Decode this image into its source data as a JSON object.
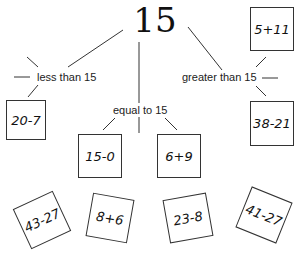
{
  "root": {
    "value": "15"
  },
  "categories": {
    "less": {
      "label": "less than 15"
    },
    "equal": {
      "label": "equal to 15"
    },
    "greater": {
      "label": "greater than 15"
    }
  },
  "sorted_cards": {
    "less": [
      "20-7"
    ],
    "equal": [
      "15-0",
      "6+9"
    ],
    "greater": [
      "5+11",
      "38-21"
    ]
  },
  "unsorted_cards": [
    "43-27",
    "8+6",
    "23-8",
    "41-27"
  ],
  "colors": {
    "line": "#333333",
    "text": "#111111",
    "background": "#ffffff"
  }
}
